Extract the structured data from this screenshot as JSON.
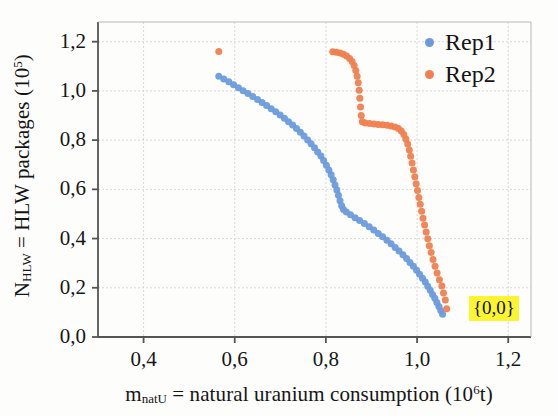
{
  "chart_data": {
    "type": "scatter",
    "title": "",
    "xlabel": "m_natU = natural uranium consumption (10^6 t)",
    "ylabel": "N_HLW = HLW packages (10^5)",
    "xlabel_parts": {
      "symbol": "m",
      "symbol_sub": "natU",
      "text": " = natural uranium consumption (10",
      "exp": "6",
      "tail": "t)"
    },
    "ylabel_parts": {
      "symbol": "N",
      "symbol_sub": "HLW",
      "text": " = HLW packages (10",
      "exp": "5",
      "tail": ")"
    },
    "xlim": [
      0.3,
      1.25
    ],
    "ylim": [
      0.0,
      1.28
    ],
    "grid": true,
    "legend_position": "top-right",
    "xticks": [
      0.4,
      0.6,
      0.8,
      1.0,
      1.2
    ],
    "xtick_labels": [
      "0,4",
      "0,6",
      "0,8",
      "1,0",
      "1,2"
    ],
    "yticks": [
      0.0,
      0.2,
      0.4,
      0.6,
      0.8,
      1.0,
      1.2
    ],
    "ytick_labels": [
      "0,0",
      "0,2",
      "0,4",
      "0,6",
      "0,8",
      "1,0",
      "1,2"
    ],
    "annotations": [
      {
        "text": "{0,0}",
        "x": 1.11,
        "y": 0.155,
        "highlight": "#fbf531"
      }
    ],
    "series": [
      {
        "name": "Rep1",
        "color": "#6b9bdc",
        "marker": "circle",
        "marker_size": 7,
        "points": [
          [
            0.565,
            1.06
          ],
          [
            0.576,
            1.048
          ],
          [
            0.587,
            1.037
          ],
          [
            0.5975,
            1.025
          ],
          [
            0.608,
            1.013
          ],
          [
            0.6185,
            1.001
          ],
          [
            0.629,
            0.989
          ],
          [
            0.6395,
            0.977
          ],
          [
            0.65,
            0.965
          ],
          [
            0.66,
            0.953
          ],
          [
            0.67,
            0.941
          ],
          [
            0.68,
            0.928
          ],
          [
            0.69,
            0.915
          ],
          [
            0.6995,
            0.902
          ],
          [
            0.709,
            0.889
          ],
          [
            0.718,
            0.875
          ],
          [
            0.727,
            0.861
          ],
          [
            0.7355,
            0.847
          ],
          [
            0.744,
            0.832
          ],
          [
            0.752,
            0.817
          ],
          [
            0.76,
            0.801
          ],
          [
            0.7675,
            0.785
          ],
          [
            0.775,
            0.769
          ],
          [
            0.782,
            0.752
          ],
          [
            0.789,
            0.735
          ],
          [
            0.795,
            0.717
          ],
          [
            0.801,
            0.698
          ],
          [
            0.8065,
            0.679
          ],
          [
            0.8115,
            0.659
          ],
          [
            0.816,
            0.639
          ],
          [
            0.82,
            0.618
          ],
          [
            0.824,
            0.597
          ],
          [
            0.8275,
            0.576
          ],
          [
            0.831,
            0.554
          ],
          [
            0.8345,
            0.533
          ],
          [
            0.8385,
            0.518
          ],
          [
            0.845,
            0.508
          ],
          [
            0.854,
            0.497
          ],
          [
            0.864,
            0.485
          ],
          [
            0.874,
            0.473
          ],
          [
            0.8845,
            0.461
          ],
          [
            0.895,
            0.448
          ],
          [
            0.905,
            0.435
          ],
          [
            0.915,
            0.421
          ],
          [
            0.9245,
            0.407
          ],
          [
            0.934,
            0.393
          ],
          [
            0.943,
            0.379
          ],
          [
            0.952,
            0.364
          ],
          [
            0.9605,
            0.349
          ],
          [
            0.969,
            0.334
          ],
          [
            0.977,
            0.319
          ],
          [
            0.9845,
            0.303
          ],
          [
            0.992,
            0.287
          ],
          [
            0.999,
            0.271
          ],
          [
            1.0055,
            0.255
          ],
          [
            1.012,
            0.239
          ],
          [
            1.018,
            0.223
          ],
          [
            1.0235,
            0.206
          ],
          [
            1.029,
            0.19
          ],
          [
            1.034,
            0.173
          ],
          [
            1.039,
            0.157
          ],
          [
            1.0435,
            0.14
          ],
          [
            1.048,
            0.124
          ],
          [
            1.052,
            0.108
          ],
          [
            1.056,
            0.092
          ]
        ]
      },
      {
        "name": "Rep2",
        "color": "#f0804f",
        "marker": "circle",
        "marker_size": 7,
        "points": [
          [
            0.565,
            1.16
          ],
          [
            0.815,
            1.159
          ],
          [
            0.823,
            1.157
          ],
          [
            0.831,
            1.154
          ],
          [
            0.8385,
            1.149
          ],
          [
            0.8455,
            1.142
          ],
          [
            0.852,
            1.132
          ],
          [
            0.8575,
            1.119
          ],
          [
            0.862,
            1.103
          ],
          [
            0.8655,
            1.083
          ],
          [
            0.8685,
            1.06
          ],
          [
            0.871,
            1.033
          ],
          [
            0.873,
            1.003
          ],
          [
            0.8745,
            0.97
          ],
          [
            0.876,
            0.935
          ],
          [
            0.8775,
            0.9
          ],
          [
            0.88,
            0.875
          ],
          [
            0.8865,
            0.87
          ],
          [
            0.896,
            0.868
          ],
          [
            0.9055,
            0.866
          ],
          [
            0.915,
            0.864
          ],
          [
            0.9245,
            0.862
          ],
          [
            0.934,
            0.86
          ],
          [
            0.943,
            0.857
          ],
          [
            0.9515,
            0.853
          ],
          [
            0.959,
            0.847
          ],
          [
            0.9655,
            0.837
          ],
          [
            0.971,
            0.823
          ],
          [
            0.9755,
            0.805
          ],
          [
            0.9795,
            0.784
          ],
          [
            0.983,
            0.76
          ],
          [
            0.986,
            0.734
          ],
          [
            0.989,
            0.707
          ],
          [
            0.992,
            0.679
          ],
          [
            0.995,
            0.651
          ],
          [
            0.998,
            0.623
          ],
          [
            1.001,
            0.595
          ],
          [
            1.004,
            0.567
          ],
          [
            1.007,
            0.539
          ],
          [
            1.01,
            0.511
          ],
          [
            1.013,
            0.483
          ],
          [
            1.0165,
            0.455
          ],
          [
            1.02,
            0.427
          ],
          [
            1.0235,
            0.399
          ],
          [
            1.027,
            0.371
          ],
          [
            1.031,
            0.343
          ],
          [
            1.035,
            0.315
          ],
          [
            1.0395,
            0.287
          ],
          [
            1.044,
            0.26
          ],
          [
            1.049,
            0.233
          ],
          [
            1.0545,
            0.207
          ],
          [
            1.058,
            0.179
          ],
          [
            1.062,
            0.15
          ],
          [
            1.065,
            0.115
          ]
        ]
      }
    ]
  },
  "legend": {
    "entries": [
      {
        "label": "Rep1",
        "color": "#6b9bdc"
      },
      {
        "label": "Rep2",
        "color": "#f0804f"
      }
    ]
  },
  "style": {
    "axis_color": "#555555",
    "grid_color": "#cfcfcf",
    "background": "#fdfdfc",
    "text_color": "#151515"
  }
}
